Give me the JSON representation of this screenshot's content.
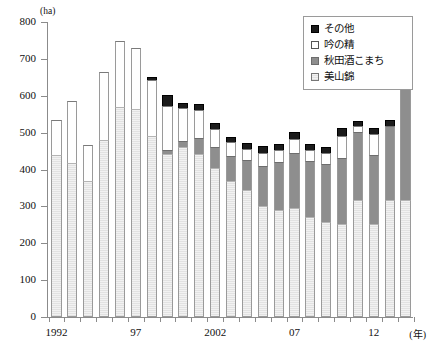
{
  "chart_data": {
    "type": "bar",
    "stacked": true,
    "title": "",
    "subtitle": "",
    "xlabel": "(年)",
    "ylabel": "(ha)",
    "unit": "ha",
    "ylim": [
      0,
      800
    ],
    "ytick_step": 100,
    "ytick_labels": [
      "0",
      "100",
      "200",
      "300",
      "400",
      "500",
      "600",
      "700",
      "800"
    ],
    "grid": false,
    "legend_position": "top-right",
    "x": [
      1992,
      1993,
      1994,
      1995,
      1996,
      1997,
      1998,
      1999,
      2000,
      2001,
      2002,
      2003,
      2004,
      2005,
      2006,
      2007,
      2008,
      2009,
      2010,
      2011,
      2012,
      2013,
      2014
    ],
    "categories": [
      "1992",
      "1993",
      "1994",
      "1995",
      "1996",
      "1997",
      "1998",
      "1999",
      "2000",
      "2001",
      "2002",
      "2003",
      "2004",
      "2005",
      "2006",
      "2007",
      "2008",
      "2009",
      "2010",
      "2011",
      "2012",
      "2013",
      "2014"
    ],
    "xtick_labels": [
      "1992",
      "97",
      "2002",
      "07",
      "12"
    ],
    "xtick_index": [
      0,
      5,
      10,
      15,
      20
    ],
    "series": [
      {
        "name": "美山錦",
        "color": "#e2e2e2",
        "values": [
          440,
          418,
          370,
          480,
          570,
          565,
          492,
          443,
          460,
          443,
          405,
          368,
          345,
          300,
          290,
          295,
          272,
          258,
          252,
          318,
          252,
          318,
          318
        ]
      },
      {
        "name": "秋田酒こまち",
        "color": "#8e8e8e",
        "values": [
          0,
          0,
          0,
          0,
          0,
          0,
          0,
          10,
          16,
          42,
          55,
          68,
          80,
          110,
          130,
          150,
          152,
          158,
          180,
          185,
          188,
          200,
          312
        ]
      },
      {
        "name": "吟の精",
        "color": "#ffffff",
        "values": [
          95,
          168,
          97,
          185,
          178,
          165,
          150,
          118,
          90,
          77,
          50,
          38,
          30,
          35,
          32,
          38,
          30,
          30,
          58,
          15,
          55,
          0,
          20
        ]
      },
      {
        "name": "その他",
        "color": "#1b1b1b",
        "values": [
          0,
          0,
          0,
          0,
          0,
          0,
          8,
          30,
          14,
          15,
          16,
          14,
          18,
          18,
          16,
          20,
          16,
          16,
          22,
          14,
          18,
          15,
          18
        ]
      }
    ],
    "totals": [
      535,
      586,
      467,
      665,
      748,
      730,
      650,
      601,
      580,
      577,
      526,
      488,
      473,
      463,
      468,
      503,
      470,
      462,
      512,
      532,
      513,
      533,
      668
    ]
  },
  "legend": {
    "items": [
      {
        "label": "その他",
        "icon": "black-square-swatch"
      },
      {
        "label": "吟の精",
        "icon": "white-square-swatch"
      },
      {
        "label": "秋田酒こまち",
        "icon": "gray-square-swatch"
      },
      {
        "label": "美山錦",
        "icon": "hatched-square-swatch"
      }
    ]
  },
  "axes": {
    "y_unit": "(ha)",
    "x_unit": "(年)",
    "y_ticks": [
      "800",
      "700",
      "600",
      "500",
      "400",
      "300",
      "200",
      "100",
      "0"
    ],
    "x_ticks": [
      "1992",
      "97",
      "2002",
      "07",
      "12"
    ]
  }
}
